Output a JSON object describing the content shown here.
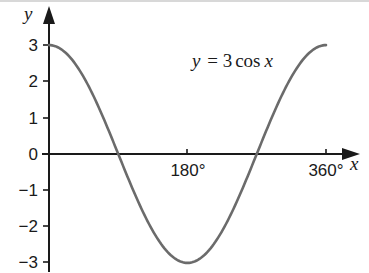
{
  "chart_data": {
    "type": "line",
    "title": "",
    "annotation": "y = 3 cos x",
    "xlabel": "x",
    "ylabel": "y",
    "x_ticks": [
      "180°",
      "360°"
    ],
    "y_ticks": [
      "3",
      "2",
      "1",
      "0",
      "−1",
      "−2",
      "−3"
    ],
    "xlim": [
      0,
      360
    ],
    "ylim": [
      -3,
      3
    ],
    "grid": false,
    "series": [
      {
        "name": "y = 3cos x",
        "color": "#6b6b6b",
        "x": [
          0,
          30,
          60,
          90,
          120,
          150,
          180,
          210,
          240,
          270,
          300,
          330,
          360
        ],
        "values": [
          3,
          2.6,
          1.5,
          0,
          -1.5,
          -2.6,
          -3,
          -2.6,
          -1.5,
          0,
          1.5,
          2.6,
          3
        ]
      }
    ]
  },
  "labels": {
    "y_axis": "y",
    "x_axis": "x",
    "equation": {
      "lhs": "y",
      "eq": " = 3",
      "fn": "cos",
      "var": "x"
    },
    "y_ticks": [
      "3",
      "2",
      "1",
      "0",
      "−1",
      "−2",
      "−3"
    ],
    "x_ticks": [
      "180°",
      "360°"
    ]
  }
}
